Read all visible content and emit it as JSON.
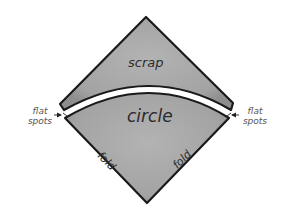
{
  "diagram": {
    "type": "folded-square-circle-cut",
    "labels": {
      "scrap": "scrap",
      "circle": "circle",
      "fold_left": "fold",
      "fold_right": "fold",
      "flat_spots_left": "flat spots",
      "flat_spots_right": "flat spots"
    },
    "colors": {
      "fill": "#a6a6a6",
      "outline": "#1a1a1a",
      "background": "#ffffff",
      "gap": "#ffffff"
    },
    "parts": [
      {
        "name": "scrap",
        "description": "top triangular scrap piece above curved cut"
      },
      {
        "name": "circle",
        "description": "lower piece bounded by curved cut and two folds"
      }
    ],
    "annotations": [
      {
        "label": "flat spots",
        "side": "left",
        "arrow": "points right"
      },
      {
        "label": "flat spots",
        "side": "right",
        "arrow": "points left"
      }
    ]
  }
}
